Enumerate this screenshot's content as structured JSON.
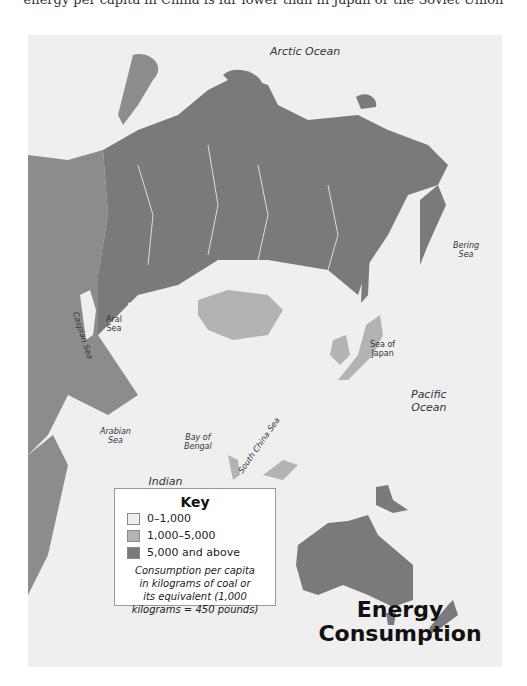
{
  "caption": "energy per capita in China is far lower than in Japan or the Soviet Union",
  "map": {
    "title_line1": "Energy",
    "title_line2": "Consumption",
    "labels": {
      "arctic": "Arctic Ocean",
      "bering_1": "Bering",
      "bering_2": "Sea",
      "aral_1": "Aral",
      "aral_2": "Sea",
      "caspian": "Caspian Sea",
      "japan_1": "Sea of",
      "japan_2": "Japan",
      "pacific_1": "Pacific",
      "pacific_2": "Ocean",
      "arabian_1": "Arabian",
      "arabian_2": "Sea",
      "bengal_1": "Bay of",
      "bengal_2": "Bengal",
      "scs": "South China Sea",
      "indian_1": "Indian",
      "indian_2": "Ocean"
    },
    "colors": {
      "water": "#efefef",
      "low": "#eeeeee",
      "mid": "#b3b3b3",
      "high": "#7a7a7a",
      "west": "#8c8c8c"
    }
  },
  "key": {
    "title": "Key",
    "items": [
      {
        "label": "0–1,000",
        "color": "#eeeeee"
      },
      {
        "label": "1,000–5,000",
        "color": "#b3b3b3"
      },
      {
        "label": "5,000 and above",
        "color": "#7a7a7a"
      }
    ],
    "note_1": "Consumption per capita",
    "note_2": "in kilograms of coal or",
    "note_3": "its equivalent (1,000",
    "note_4": "kilograms = 450 pounds)"
  }
}
